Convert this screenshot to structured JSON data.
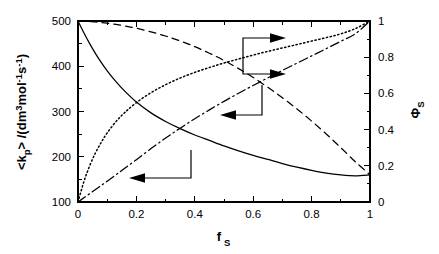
{
  "chart_data": {
    "type": "line",
    "title": "",
    "xlabel": "f_S",
    "xlabel_base": "f",
    "xlabel_sub": "S",
    "ylabel_left": "<k_p>/(dm3 mol-1 s-1)",
    "ylabel_right": "phi_S",
    "xlim": [
      0,
      1
    ],
    "ylim_left": [
      100,
      500
    ],
    "ylim_right": [
      0,
      1
    ],
    "grid": false,
    "legend": "none",
    "x_ticks": [
      "0",
      "0.2",
      "0.4",
      "0.6",
      "0.8",
      "1"
    ],
    "x_tick_values": [
      0,
      0.2,
      0.4,
      0.6,
      0.8,
      1
    ],
    "x_minor_step": 0.1,
    "y_left_ticks": [
      "100",
      "200",
      "300",
      "400",
      "500"
    ],
    "y_left_tick_values": [
      100,
      200,
      300,
      400,
      500
    ],
    "y_left_minor_step": 50,
    "y_right_ticks": [
      "0",
      "0.2",
      "0.4",
      "0.6",
      "0.8",
      "1"
    ],
    "y_right_tick_values": [
      0,
      0.2,
      0.4,
      0.6,
      0.8,
      1
    ],
    "y_right_minor_step": 0.1,
    "x": [
      0,
      0.02,
      0.04,
      0.06,
      0.08,
      0.1,
      0.13,
      0.16,
      0.2,
      0.25,
      0.3,
      0.35,
      0.4,
      0.45,
      0.5,
      0.55,
      0.6,
      0.65,
      0.7,
      0.75,
      0.8,
      0.85,
      0.9,
      0.95,
      1
    ],
    "series": [
      {
        "name": "average propagation rate coefficient",
        "axis": "left",
        "style": "solid",
        "values": [
          500,
          474,
          450,
          428,
          408,
          390,
          366,
          345,
          321,
          297,
          278,
          262,
          248,
          236,
          224,
          213,
          203,
          194,
          185,
          177,
          170,
          164,
          160,
          158,
          160
        ]
      },
      {
        "name": "dashed fraction curve",
        "axis": "right",
        "style": "dashed",
        "values": [
          1.0,
          0.999,
          0.997,
          0.995,
          0.992,
          0.988,
          0.981,
          0.973,
          0.96,
          0.94,
          0.917,
          0.89,
          0.858,
          0.822,
          0.782,
          0.737,
          0.688,
          0.634,
          0.576,
          0.514,
          0.447,
          0.376,
          0.3,
          0.222,
          0.15
        ]
      },
      {
        "name": "dotted fraction curve",
        "axis": "right",
        "style": "dotted",
        "values": [
          0,
          0.112,
          0.2,
          0.272,
          0.331,
          0.382,
          0.444,
          0.494,
          0.549,
          0.604,
          0.648,
          0.685,
          0.716,
          0.743,
          0.768,
          0.79,
          0.812,
          0.832,
          0.851,
          0.87,
          0.889,
          0.908,
          0.929,
          0.958,
          1.0
        ]
      },
      {
        "name": "dash-dot fraction curve",
        "axis": "right",
        "style": "dashdot",
        "values": [
          0,
          0.023,
          0.046,
          0.069,
          0.092,
          0.115,
          0.15,
          0.186,
          0.234,
          0.295,
          0.353,
          0.408,
          0.46,
          0.509,
          0.556,
          0.601,
          0.644,
          0.686,
          0.727,
          0.767,
          0.807,
          0.847,
          0.888,
          0.93,
          1.0
        ]
      }
    ],
    "annotations": [
      {
        "name": "left-axis-arrow-upper",
        "direction": "left",
        "target_axis": "left",
        "refers_to": "dashed fraction curve"
      },
      {
        "name": "left-axis-arrow-lower",
        "direction": "left",
        "target_axis": "left",
        "refers_to": "average propagation rate coefficient"
      },
      {
        "name": "right-axis-arrow-upper",
        "direction": "right",
        "target_axis": "right",
        "refers_to": "dotted fraction curve"
      },
      {
        "name": "right-axis-arrow-lower",
        "direction": "right",
        "target_axis": "right",
        "refers_to": "dash-dot fraction curve"
      }
    ]
  }
}
